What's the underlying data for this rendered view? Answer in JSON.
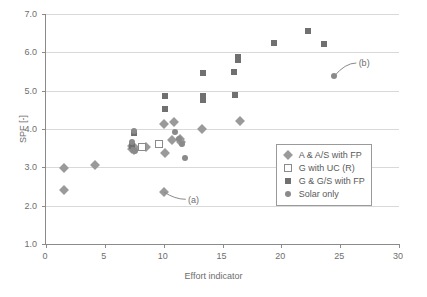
{
  "chart_data": {
    "type": "scatter",
    "title": "",
    "xlabel": "Effort indicator",
    "ylabel": "SPF [-]",
    "xlim": [
      0,
      30
    ],
    "ylim": [
      1.0,
      7.0
    ],
    "xticks": [
      "0",
      "5",
      "10",
      "15",
      "20",
      "25",
      "30"
    ],
    "xtick_values": [
      0,
      5,
      10,
      15,
      20,
      25,
      30
    ],
    "yticks": [
      "1.0",
      "2.0",
      "3.0",
      "4.0",
      "5.0",
      "6.0",
      "7.0"
    ],
    "ytick_values": [
      1.0,
      2.0,
      3.0,
      4.0,
      5.0,
      6.0,
      7.0
    ],
    "grid": "horizontal",
    "legend_position": "lower right",
    "series": [
      {
        "name": "A & A/S with FP",
        "marker": "diamond",
        "color": "#9a9a9a",
        "points": [
          [
            1.5,
            2.99
          ],
          [
            1.5,
            2.4
          ],
          [
            4.15,
            3.06
          ],
          [
            7.3,
            3.56
          ],
          [
            7.35,
            3.48
          ],
          [
            7.5,
            3.44
          ],
          [
            7.6,
            3.5
          ],
          [
            8.5,
            3.53
          ],
          [
            10.0,
            4.12
          ],
          [
            10.1,
            3.37
          ],
          [
            10.05,
            2.35
          ],
          [
            10.9,
            4.18
          ],
          [
            10.75,
            3.72
          ],
          [
            11.4,
            3.73
          ],
          [
            11.5,
            3.65
          ],
          [
            13.3,
            4.0
          ],
          [
            16.5,
            4.22
          ]
        ]
      },
      {
        "name": "G with UC (R)",
        "marker": "open-square",
        "color": "#ffffff",
        "points": [
          [
            8.2,
            3.52
          ],
          [
            9.6,
            3.6
          ]
        ]
      },
      {
        "name": "G & G/S with FP",
        "marker": "square",
        "color": "#707070",
        "points": [
          [
            7.5,
            3.9
          ],
          [
            7.35,
            3.56
          ],
          [
            10.1,
            4.86
          ],
          [
            10.1,
            4.53
          ],
          [
            13.35,
            5.47
          ],
          [
            13.35,
            4.86
          ],
          [
            13.35,
            4.76
          ],
          [
            16.0,
            5.5
          ],
          [
            16.35,
            5.87
          ],
          [
            16.3,
            5.79
          ],
          [
            16.05,
            4.88
          ],
          [
            19.4,
            6.24
          ],
          [
            22.3,
            6.55
          ],
          [
            23.6,
            6.22
          ]
        ]
      },
      {
        "name": "Solar only",
        "marker": "circle",
        "color": "#8a8a8a",
        "points": [
          [
            7.45,
            3.96
          ],
          [
            7.3,
            3.66
          ],
          [
            7.4,
            3.46
          ],
          [
            7.55,
            3.42
          ],
          [
            10.95,
            3.92
          ],
          [
            11.3,
            3.74
          ],
          [
            11.55,
            3.62
          ],
          [
            11.8,
            3.24
          ],
          [
            24.5,
            5.37
          ]
        ]
      }
    ],
    "annotations": [
      {
        "label": "(a)",
        "text_x": 11.9,
        "text_y": 2.16,
        "point_x": 10.05,
        "point_y": 2.35
      },
      {
        "label": "(b)",
        "text_x": 26.4,
        "text_y": 5.72,
        "point_x": 24.5,
        "point_y": 5.37
      }
    ]
  },
  "legend": {
    "items": [
      {
        "label": "A & A/S with FP",
        "marker": "diamond"
      },
      {
        "label": "G with UC (R)",
        "marker": "open-square"
      },
      {
        "label": "G & G/S with FP",
        "marker": "square"
      },
      {
        "label": "Solar only",
        "marker": "circle"
      }
    ]
  }
}
